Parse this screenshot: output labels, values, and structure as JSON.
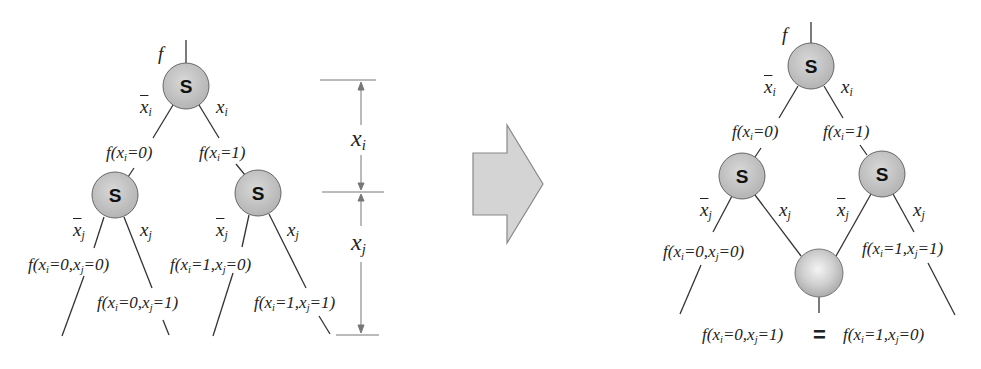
{
  "figure": {
    "arrow_color": "#d4d4d4",
    "node_fill": "#c4c4c4",
    "line_color": "#333333",
    "node_label": "S",
    "left_tree": {
      "root_label": "f",
      "root_edges": {
        "neg": "x",
        "neg_sub": "i",
        "pos": "x",
        "pos_sub": "i"
      },
      "child_labels": {
        "left": "f(x",
        "left_sub": "i",
        "left_tail": "=0)",
        "right": "f(x",
        "right_sub": "i",
        "right_tail": "=1)"
      },
      "grandchild_edges": {
        "neg": "x",
        "neg_sub": "j",
        "pos": "x",
        "pos_sub": "j"
      },
      "leaves": [
        {
          "pre": "f(x",
          "s1": "i",
          "mid": "=0,x",
          "s2": "j",
          "post": "=0)"
        },
        {
          "pre": "f(x",
          "s1": "i",
          "mid": "=0,x",
          "s2": "j",
          "post": "=1)"
        },
        {
          "pre": "f(x",
          "s1": "i",
          "mid": "=1,x",
          "s2": "j",
          "post": "=0)"
        },
        {
          "pre": "f(x",
          "s1": "i",
          "mid": "=1,x",
          "s2": "j",
          "post": "=1)"
        }
      ]
    },
    "dimension": {
      "upper": "x",
      "upper_sub": "i",
      "lower": "x",
      "lower_sub": "j"
    },
    "right_tree": {
      "root_label": "f",
      "leaves": [
        {
          "pre": "f(x",
          "s1": "i",
          "mid": "=0,x",
          "s2": "j",
          "post": "=0)"
        },
        {
          "pre": "f(x",
          "s1": "i",
          "mid": "=1,x",
          "s2": "j",
          "post": "=1)"
        }
      ],
      "merged": {
        "left": {
          "pre": "f(x",
          "s1": "i",
          "mid": "=0,x",
          "s2": "j",
          "post": "=1)"
        },
        "equals": "=",
        "right": {
          "pre": "f(x",
          "s1": "i",
          "mid": "=1,x",
          "s2": "j",
          "post": "=0)"
        }
      }
    }
  }
}
